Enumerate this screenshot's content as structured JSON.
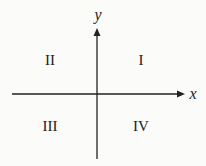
{
  "diagram": {
    "axes": {
      "x_label": "x",
      "y_label": "y"
    },
    "quadrants": [
      {
        "id": "I",
        "label": "I"
      },
      {
        "id": "II",
        "label": "II"
      },
      {
        "id": "III",
        "label": "III"
      },
      {
        "id": "IV",
        "label": "IV"
      }
    ],
    "colors": {
      "background": "#fbfbf9",
      "ink": "#222222"
    }
  }
}
